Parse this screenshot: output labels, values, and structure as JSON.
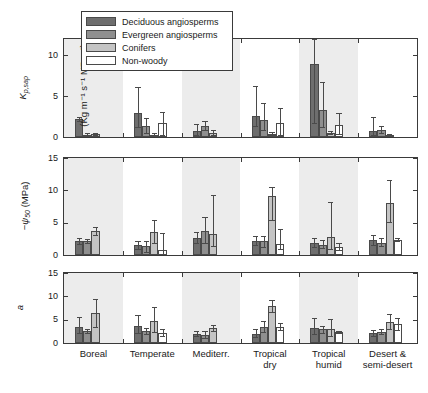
{
  "figure": {
    "background": "#ffffff",
    "band_color": "#ececec",
    "axis_color": "#3a3a3a"
  },
  "legend": {
    "position": "top-left-inside-panel-1",
    "entries": [
      {
        "label": "Deciduous angiosperms",
        "color": "#6e6e6e"
      },
      {
        "label": "Evergreen angiosperms",
        "color": "#8f8f8f"
      },
      {
        "label": "Conifers",
        "color": "#c4c4c4"
      },
      {
        "label": "Non-woody",
        "color": "#ffffff"
      }
    ]
  },
  "chart_data": [
    {
      "type": "bar",
      "panel": "top",
      "title": "",
      "ylabel": "K_p,sap (Kg m^-1 s^-1 MPa^-1)",
      "ylabel_main": "K",
      "ylabel_main_sub": "p,sap",
      "ylabel_units": "(Kg m⁻¹ s⁻¹ MPa⁻¹)",
      "xlabel": "",
      "ylim": [
        0,
        12
      ],
      "yticks": [
        0,
        5,
        10
      ],
      "ytick_labels": [
        "0",
        "5",
        "10"
      ],
      "grid": false,
      "categories": [
        "Boreal",
        "Temperate",
        "Mediterr.",
        "Tropical dry",
        "Tropical humid",
        "Desert & semi-desert"
      ],
      "series": [
        {
          "name": "Deciduous angiosperms",
          "color": "#6e6e6e",
          "values": [
            2.2,
            3.0,
            0.7,
            2.6,
            8.9,
            0.7
          ],
          "err_low": [
            1.9,
            1.2,
            0.2,
            1.3,
            1.7,
            0.2
          ],
          "err_high": [
            2.5,
            6.1,
            1.6,
            6.2,
            12.0,
            2.4
          ]
        },
        {
          "name": "Evergreen angiosperms",
          "color": "#8f8f8f",
          "values": [
            0.3,
            1.3,
            1.35,
            2.1,
            3.3,
            0.9
          ],
          "err_low": [
            0.2,
            0.5,
            0.9,
            0.8,
            1.2,
            0.5
          ],
          "err_high": [
            0.45,
            2.3,
            1.9,
            4.2,
            6.7,
            1.4
          ]
        },
        {
          "name": "Conifers",
          "color": "#c4c4c4",
          "values": [
            0.4,
            0.3,
            0.5,
            0.35,
            0.5,
            0.25
          ],
          "err_low": [
            0.3,
            0.2,
            0.3,
            0.2,
            0.35,
            0.15
          ],
          "err_high": [
            0.55,
            0.45,
            0.9,
            0.6,
            0.7,
            0.4
          ]
        },
        {
          "name": "Non-woody",
          "color": "#ffffff",
          "values": [
            null,
            1.7,
            null,
            1.7,
            1.45,
            null
          ],
          "err_low": [
            null,
            0.2,
            null,
            0.2,
            0.4,
            null
          ],
          "err_high": [
            null,
            3.1,
            null,
            3.6,
            2.9,
            null
          ]
        }
      ]
    },
    {
      "type": "bar",
      "panel": "middle",
      "title": "",
      "ylabel": "-psi_50 (MPa)",
      "ylabel_main": "−ψ",
      "ylabel_main_sub": "50",
      "ylabel_units": "(MPa)",
      "xlabel": "",
      "ylim": [
        0,
        15
      ],
      "yticks": [
        0,
        5,
        10,
        15
      ],
      "ytick_labels": [
        "0",
        "5",
        "10",
        "15"
      ],
      "grid": false,
      "categories": [
        "Boreal",
        "Temperate",
        "Mediterr.",
        "Tropical dry",
        "Tropical humid",
        "Desert & semi-desert"
      ],
      "series": [
        {
          "name": "Deciduous angiosperms",
          "color": "#6e6e6e",
          "values": [
            2.1,
            1.5,
            2.6,
            2.2,
            1.9,
            2.3
          ],
          "err_low": [
            1.7,
            1.0,
            1.8,
            1.6,
            1.3,
            1.6
          ],
          "err_high": [
            2.6,
            2.1,
            3.5,
            2.9,
            2.7,
            3.1
          ]
        },
        {
          "name": "Evergreen angiosperms",
          "color": "#8f8f8f",
          "values": [
            2.15,
            1.35,
            3.7,
            2.1,
            1.6,
            1.8
          ],
          "err_low": [
            1.8,
            0.5,
            1.9,
            1.3,
            1.1,
            1.4
          ],
          "err_high": [
            2.5,
            2.2,
            5.9,
            3.0,
            2.3,
            2.6
          ]
        },
        {
          "name": "Conifers",
          "color": "#c4c4c4",
          "values": [
            3.7,
            3.6,
            3.3,
            9.1,
            2.8,
            8.1
          ],
          "err_low": [
            3.1,
            1.9,
            1.4,
            5.4,
            0.9,
            5.1
          ],
          "err_high": [
            4.4,
            5.4,
            9.3,
            10.5,
            8.2,
            11.6
          ]
        },
        {
          "name": "Non-woody",
          "color": "#ffffff",
          "values": [
            null,
            0.75,
            null,
            1.7,
            1.3,
            2.35
          ],
          "err_low": [
            null,
            0.1,
            null,
            0.9,
            0.8,
            2.1
          ],
          "err_high": [
            null,
            3.4,
            null,
            4.0,
            1.8,
            2.6
          ]
        }
      ]
    },
    {
      "type": "bar",
      "panel": "bottom",
      "title": "",
      "ylabel": "a",
      "ylabel_main": "a",
      "ylabel_main_sub": "",
      "ylabel_units": "",
      "xlabel": "",
      "ylim": [
        0,
        15
      ],
      "yticks": [
        0,
        5,
        10,
        15
      ],
      "ytick_labels": [
        "0",
        "5",
        "10",
        "15"
      ],
      "grid": false,
      "categories": [
        "Boreal",
        "Temperate",
        "Mediterr.",
        "Tropical dry",
        "Tropical humid",
        "Desert & semi-desert"
      ],
      "series": [
        {
          "name": "Deciduous angiosperms",
          "color": "#6e6e6e",
          "values": [
            3.5,
            3.7,
            1.9,
            2.0,
            3.2,
            2.1
          ],
          "err_low": [
            2.1,
            2.1,
            1.4,
            1.3,
            1.9,
            1.5
          ],
          "err_high": [
            5.5,
            6.0,
            2.6,
            3.1,
            5.4,
            2.8
          ]
        },
        {
          "name": "Evergreen angiosperms",
          "color": "#8f8f8f",
          "values": [
            2.5,
            2.6,
            1.7,
            3.4,
            2.9,
            2.4
          ],
          "err_low": [
            2.1,
            2.0,
            1.1,
            2.4,
            2.2,
            2.0
          ],
          "err_high": [
            2.9,
            3.3,
            2.5,
            4.7,
            3.7,
            2.9
          ]
        },
        {
          "name": "Conifers",
          "color": "#c4c4c4",
          "values": [
            6.5,
            4.8,
            3.2,
            8.0,
            3.1,
            4.4
          ],
          "err_low": [
            3.4,
            2.4,
            2.6,
            6.7,
            1.6,
            2.9
          ],
          "err_high": [
            9.4,
            7.7,
            3.9,
            9.2,
            5.1,
            6.2
          ]
        },
        {
          "name": "Non-woody",
          "color": "#ffffff",
          "values": [
            null,
            2.1,
            null,
            3.4,
            2.4,
            4.0
          ],
          "err_low": [
            null,
            1.4,
            null,
            2.7,
            2.2,
            2.7
          ],
          "err_high": [
            null,
            2.9,
            null,
            4.2,
            2.6,
            5.4
          ]
        }
      ]
    }
  ],
  "xaxis": {
    "tick_labels": [
      [
        "Boreal"
      ],
      [
        "Temperate"
      ],
      [
        "Mediterr."
      ],
      [
        "Tropical",
        "dry"
      ],
      [
        "Tropical",
        "humid"
      ],
      [
        "Desert &",
        "semi-desert"
      ]
    ]
  }
}
